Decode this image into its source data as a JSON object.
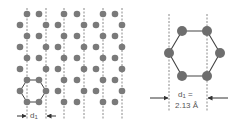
{
  "diagram": {
    "type": "crystal-lattice-schematic",
    "colors": {
      "atom": "#7a7a7a",
      "atom_large": "#6e6e6e",
      "bond": "#444444",
      "dashed": "#8a8a8a",
      "arrow": "#333333",
      "text": "#555555"
    },
    "left_panel": {
      "description": "Hexagonal lattice viewed along rows with dashed lattice planes",
      "dashed_lines_x": [
        27,
        46,
        64,
        84,
        103,
        122
      ],
      "rows_y": [
        14,
        25,
        36,
        47,
        58,
        69,
        80,
        91,
        102
      ],
      "odd_row_x": [
        27,
        39,
        64,
        77,
        103,
        115
      ],
      "even_row_x": [
        20,
        46,
        58,
        84,
        96,
        122
      ],
      "hexagon": {
        "center": [
          33,
          91
        ],
        "atoms": [
          [
            27,
            80
          ],
          [
            39,
            80
          ],
          [
            20,
            91
          ],
          [
            46,
            91
          ],
          [
            27,
            102
          ],
          [
            39,
            102
          ]
        ]
      },
      "spacing_label": {
        "symbol": "d",
        "subscript": "1"
      }
    },
    "right_panel": {
      "description": "Enlarged hexagonal unit with interplanar spacing",
      "hexagon_atoms": [
        [
          182,
          31
        ],
        [
          207,
          31
        ],
        [
          169,
          53
        ],
        [
          220,
          53
        ],
        [
          182,
          76
        ],
        [
          207,
          76
        ]
      ],
      "dashed_lines_x": [
        169,
        207
      ],
      "spacing_label": {
        "line1": "d",
        "subscript": "1",
        "equals": " =",
        "value": "2.13 Å"
      }
    }
  }
}
